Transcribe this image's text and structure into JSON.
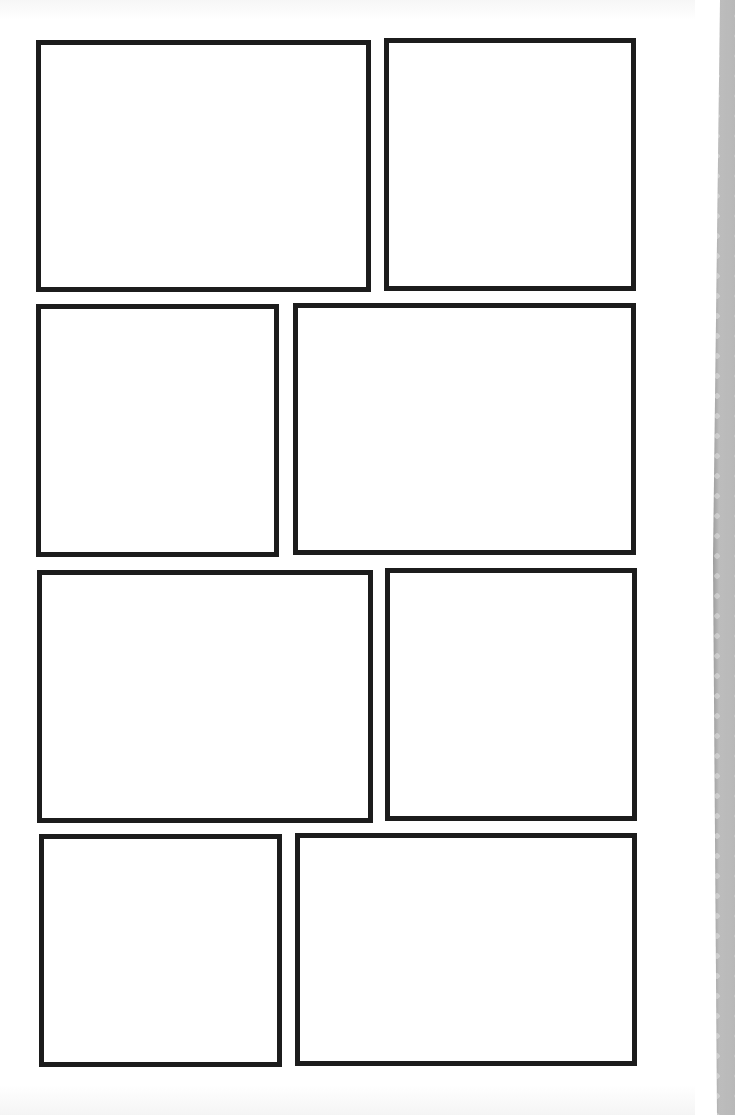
{
  "page": {
    "type": "blank comic page template",
    "panel_count": 8,
    "rows": [
      {
        "row": 1,
        "panels": [
          "panel-1",
          "panel-2"
        ]
      },
      {
        "row": 2,
        "panels": [
          "panel-3",
          "panel-4"
        ]
      },
      {
        "row": 3,
        "panels": [
          "panel-5",
          "panel-6"
        ]
      },
      {
        "row": 4,
        "panels": [
          "panel-7",
          "panel-8"
        ]
      }
    ],
    "colors": {
      "paper": "#ffffff",
      "panel_border": "#1c1c1c",
      "spine_dark": "#2a2a2a",
      "spine_light": "#d8d8d8"
    },
    "spine_decoration": "dotted-pattern"
  }
}
